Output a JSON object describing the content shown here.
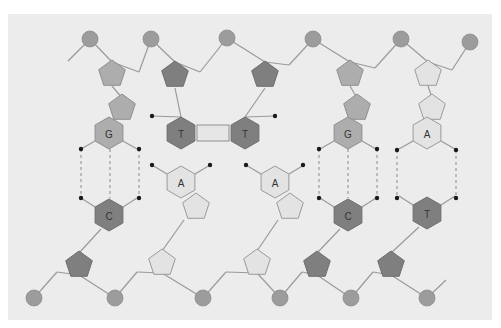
{
  "colors": {
    "panel": "#ececec",
    "dark": "#7f7f7f",
    "mid": "#adadad",
    "light": "#e3e3e3",
    "phosphate": "#9c9c9c",
    "dot": "#1a1a1a"
  },
  "panel": {
    "x": 8,
    "y": 14,
    "w": 484,
    "h": 306
  },
  "phosphates": [
    {
      "x": 90,
      "y": 39
    },
    {
      "x": 151,
      "y": 39
    },
    {
      "x": 227,
      "y": 38
    },
    {
      "x": 313,
      "y": 39
    },
    {
      "x": 401,
      "y": 39
    },
    {
      "x": 470,
      "y": 42
    },
    {
      "x": 34,
      "y": 298
    },
    {
      "x": 115,
      "y": 298
    },
    {
      "x": 203,
      "y": 298
    },
    {
      "x": 280,
      "y": 298
    },
    {
      "x": 351,
      "y": 298
    },
    {
      "x": 427,
      "y": 298
    }
  ],
  "sugars": [
    {
      "x": 112,
      "y": 74,
      "tone": "mid",
      "rot": 0
    },
    {
      "x": 175,
      "y": 75,
      "tone": "dark",
      "rot": 0
    },
    {
      "x": 265,
      "y": 75,
      "tone": "dark",
      "rot": 0
    },
    {
      "x": 350,
      "y": 74,
      "tone": "mid",
      "rot": 0
    },
    {
      "x": 428,
      "y": 74,
      "tone": "light",
      "rot": 0
    },
    {
      "x": 79,
      "y": 265,
      "tone": "dark",
      "rot": 0
    },
    {
      "x": 162,
      "y": 263,
      "tone": "light",
      "rot": 0
    },
    {
      "x": 257,
      "y": 263,
      "tone": "light",
      "rot": 0
    },
    {
      "x": 317,
      "y": 265,
      "tone": "dark",
      "rot": 0
    },
    {
      "x": 391,
      "y": 265,
      "tone": "dark",
      "rot": 0
    }
  ],
  "fused_rings": [
    {
      "x": 122,
      "y": 108,
      "tone": "mid"
    },
    {
      "x": 357,
      "y": 108,
      "tone": "mid"
    },
    {
      "x": 432,
      "y": 108,
      "tone": "light"
    },
    {
      "x": 196,
      "y": 207,
      "tone": "light"
    },
    {
      "x": 290,
      "y": 207,
      "tone": "light"
    }
  ],
  "bases": [
    {
      "id": "G1",
      "label": "G",
      "x": 109,
      "y": 133,
      "tone": "mid"
    },
    {
      "id": "T1",
      "label": "T",
      "x": 181,
      "y": 133,
      "tone": "dark"
    },
    {
      "id": "T2",
      "label": "T",
      "x": 245,
      "y": 133,
      "tone": "dark"
    },
    {
      "id": "G2",
      "label": "G",
      "x": 348,
      "y": 133,
      "tone": "mid"
    },
    {
      "id": "A1",
      "label": "A",
      "x": 427,
      "y": 133,
      "tone": "light"
    },
    {
      "id": "A2",
      "label": "A",
      "x": 181,
      "y": 182,
      "tone": "light"
    },
    {
      "id": "A3",
      "label": "A",
      "x": 275,
      "y": 182,
      "tone": "light"
    },
    {
      "id": "C1",
      "label": "C",
      "x": 109,
      "y": 215,
      "tone": "dark"
    },
    {
      "id": "C2",
      "label": "C",
      "x": 348,
      "y": 215,
      "tone": "dark"
    },
    {
      "id": "T3",
      "label": "T",
      "x": 427,
      "y": 213,
      "tone": "dark"
    }
  ],
  "pairs": [
    {
      "top": "G",
      "bottom": "C",
      "x1": 81,
      "x2": 139,
      "y1": 149,
      "y2": 198,
      "lines": 3
    },
    {
      "top": "G",
      "bottom": "C",
      "x1": 319,
      "x2": 377,
      "y1": 149,
      "y2": 198,
      "lines": 3
    },
    {
      "top": "A",
      "bottom": "T",
      "x1": 397,
      "x2": 456,
      "y1": 150,
      "y2": 198,
      "lines": 2
    }
  ],
  "dimer": {
    "label": "T=T thymine dimer",
    "x1": 197,
    "x2": 229,
    "y": 133
  },
  "free_dots": [
    {
      "x": 152,
      "y": 116
    },
    {
      "x": 275,
      "y": 116
    },
    {
      "x": 152,
      "y": 165
    },
    {
      "x": 210,
      "y": 165
    },
    {
      "x": 246,
      "y": 165
    },
    {
      "x": 303,
      "y": 165
    }
  ]
}
